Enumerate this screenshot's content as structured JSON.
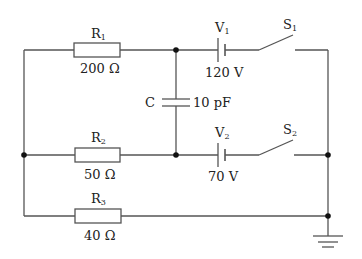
{
  "diagram": {
    "type": "circuit",
    "components": {
      "R1": {
        "name": "R",
        "sub": "1",
        "value": "200 Ω"
      },
      "R2": {
        "name": "R",
        "sub": "2",
        "value": "50 Ω"
      },
      "R3": {
        "name": "R",
        "sub": "3",
        "value": "40 Ω"
      },
      "V1": {
        "name": "V",
        "sub": "1",
        "value": "120 V"
      },
      "V2": {
        "name": "V",
        "sub": "2",
        "value": "70 V"
      },
      "S1": {
        "name": "S",
        "sub": "1"
      },
      "S2": {
        "name": "S",
        "sub": "2"
      },
      "C": {
        "name": "C",
        "value": "10 pF"
      }
    },
    "colors": {
      "wire": "#555555",
      "node": "#111111",
      "text": "#222222"
    }
  }
}
